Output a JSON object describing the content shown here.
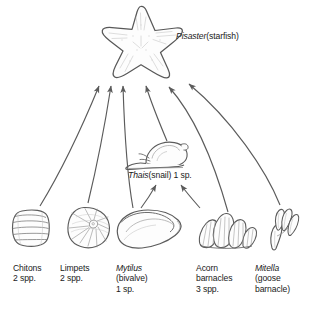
{
  "diagram": {
    "type": "food-web",
    "background_color": "#ffffff",
    "ink_color": "#4a4a4a",
    "text_color": "#1a1a1a",
    "apex": {
      "genus": "Pisaster",
      "common": "(starfish)",
      "icon": "starfish-icon"
    },
    "intermediate": {
      "genus": "Thais",
      "common": "(snail) 1 sp.",
      "icon": "snail-icon"
    },
    "prey": [
      {
        "name": "Chitons",
        "detail": "2 spp.",
        "italic": false,
        "icon": "chiton-icon"
      },
      {
        "name": "Limpets",
        "detail": "2 spp.",
        "italic": false,
        "icon": "limpet-icon"
      },
      {
        "name": "Mytilus",
        "detail": "(bivalve)\n1 sp.",
        "italic": true,
        "icon": "mussel-icon"
      },
      {
        "name": "Acorn",
        "detail": "barnacles\n3 spp.",
        "italic": false,
        "icon": "acorn-barnacle-icon"
      },
      {
        "name": "Mitella",
        "detail": "(goose\nbarnacle)",
        "italic": true,
        "icon": "goose-barnacle-icon"
      }
    ]
  }
}
